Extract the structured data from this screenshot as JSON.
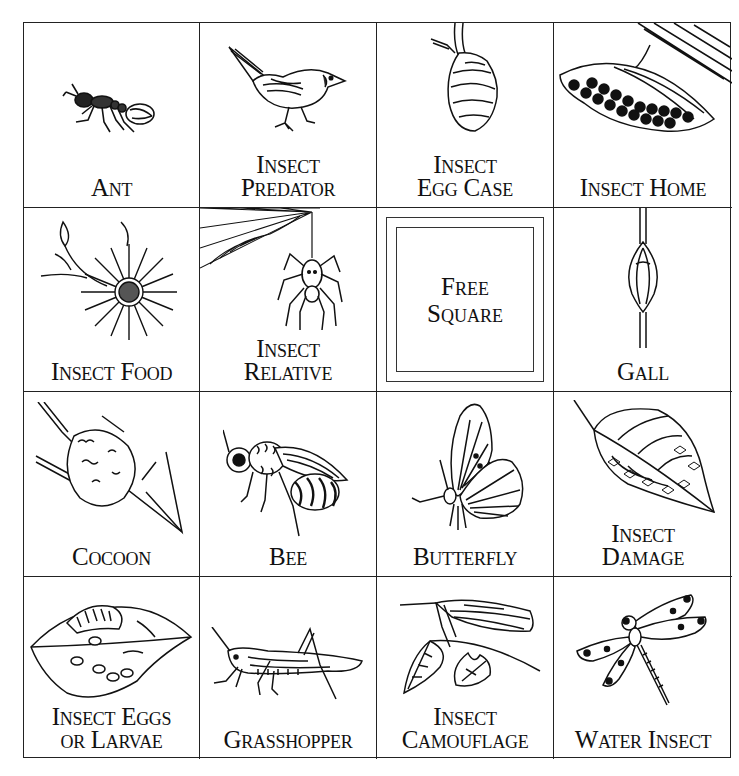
{
  "card": {
    "title": "Insect Bingo",
    "rows": 4,
    "columns": 4,
    "squares": [
      {
        "row": 1,
        "col": 1,
        "icon": "ant-icon",
        "lines": [
          "Ant"
        ]
      },
      {
        "row": 1,
        "col": 2,
        "icon": "bird-icon",
        "lines": [
          "Insect",
          "Predator"
        ]
      },
      {
        "row": 1,
        "col": 3,
        "icon": "egg-case-icon",
        "lines": [
          "Insect",
          "Egg Case"
        ]
      },
      {
        "row": 1,
        "col": 4,
        "icon": "wasp-nest-icon",
        "lines": [
          "Insect Home"
        ]
      },
      {
        "row": 2,
        "col": 1,
        "icon": "flower-icon",
        "lines": [
          "Insect Food"
        ]
      },
      {
        "row": 2,
        "col": 2,
        "icon": "spider-icon",
        "lines": [
          "Insect",
          "Relative"
        ]
      },
      {
        "row": 2,
        "col": 3,
        "icon": "free-square-frame",
        "lines": [
          "Free",
          "Square"
        ]
      },
      {
        "row": 2,
        "col": 4,
        "icon": "gall-icon",
        "lines": [
          "Gall"
        ]
      },
      {
        "row": 3,
        "col": 1,
        "icon": "cocoon-icon",
        "lines": [
          "Cocoon"
        ]
      },
      {
        "row": 3,
        "col": 2,
        "icon": "bee-icon",
        "lines": [
          "Bee"
        ]
      },
      {
        "row": 3,
        "col": 3,
        "icon": "butterfly-icon",
        "lines": [
          "Butterfly"
        ]
      },
      {
        "row": 3,
        "col": 4,
        "icon": "damaged-leaf-icon",
        "lines": [
          "Insect",
          "Damage"
        ]
      },
      {
        "row": 4,
        "col": 1,
        "icon": "larvae-leaf-icon",
        "lines": [
          "Insect Eggs",
          "or Larvae"
        ]
      },
      {
        "row": 4,
        "col": 2,
        "icon": "grasshopper-icon",
        "lines": [
          "Grasshopper"
        ]
      },
      {
        "row": 4,
        "col": 3,
        "icon": "camouflage-katydid-icon",
        "lines": [
          "Insect",
          "Camouflage"
        ]
      },
      {
        "row": 4,
        "col": 4,
        "icon": "dragonfly-icon",
        "lines": [
          "Water Insect"
        ]
      }
    ]
  },
  "colors": {
    "ink": "#111111",
    "paper": "#ffffff",
    "grid": "#222222"
  }
}
